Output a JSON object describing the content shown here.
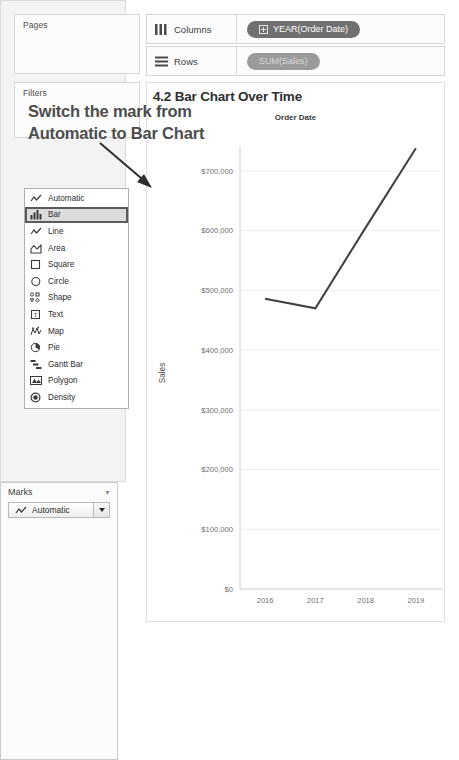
{
  "shelves": {
    "pages_label": "Pages",
    "filters_label": "Filters",
    "columns_label": "Columns",
    "rows_label": "Rows",
    "columns_pill": "YEAR(Order Date)",
    "rows_pill": "SUM(Sales)",
    "columns_icon": "columns-grid-icon",
    "rows_icon": "rows-list-icon",
    "columns_pill_color": "#707070",
    "rows_pill_color": "#9a9a9a"
  },
  "marks": {
    "title": "Marks",
    "selected": "Automatic",
    "selected_icon": "line-mark-icon",
    "dropdown_caret_icon": "chevron-down-icon",
    "collapse_icon": "caret-down-icon",
    "options": [
      {
        "label": "Automatic",
        "icon": "line-mark-icon",
        "selected": false
      },
      {
        "label": "Bar",
        "icon": "bar-mark-icon",
        "selected": true
      },
      {
        "label": "Line",
        "icon": "line-mark-icon",
        "selected": false
      },
      {
        "label": "Area",
        "icon": "area-mark-icon",
        "selected": false
      },
      {
        "label": "Square",
        "icon": "square-mark-icon",
        "selected": false
      },
      {
        "label": "Circle",
        "icon": "circle-mark-icon",
        "selected": false
      },
      {
        "label": "Shape",
        "icon": "shape-mark-icon",
        "selected": false
      },
      {
        "label": "Text",
        "icon": "text-mark-icon",
        "selected": false
      },
      {
        "label": "Map",
        "icon": "map-mark-icon",
        "selected": false
      },
      {
        "label": "Pie",
        "icon": "pie-mark-icon",
        "selected": false
      },
      {
        "label": "Gantt Bar",
        "icon": "gantt-mark-icon",
        "selected": false
      },
      {
        "label": "Polygon",
        "icon": "polygon-mark-icon",
        "selected": false
      },
      {
        "label": "Density",
        "icon": "density-mark-icon",
        "selected": false
      }
    ]
  },
  "annotation": {
    "line1": "Switch the mark from",
    "line2": "Automatic to Bar Chart",
    "arrow_icon": "arrow-down-right-icon",
    "color": "#4d4d4d"
  },
  "viz": {
    "title": "4.2 Bar Chart Over Time",
    "column_header": "Order Date"
  },
  "chart_data": {
    "type": "line",
    "title": "4.2 Bar Chart Over Time",
    "xlabel": "Order Date",
    "ylabel": "Sales",
    "x": [
      "2016",
      "2017",
      "2018",
      "2019"
    ],
    "values": [
      486000,
      470000,
      605000,
      738000
    ],
    "ytick_labels": [
      "$0",
      "$100,000",
      "$200,000",
      "$300,000",
      "$400,000",
      "$500,000",
      "$600,000",
      "$700,000"
    ],
    "yticks": [
      0,
      100000,
      200000,
      300000,
      400000,
      500000,
      600000,
      700000
    ],
    "ylim": [
      0,
      740000
    ],
    "grid": true,
    "legend": "none",
    "line_color": "#3f3f3f"
  }
}
